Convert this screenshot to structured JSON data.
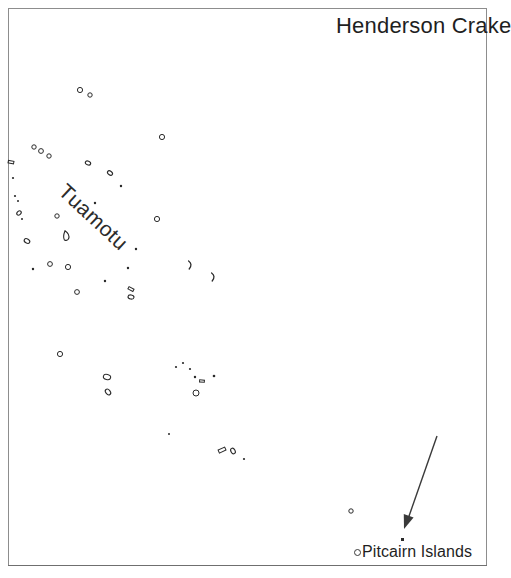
{
  "figure": {
    "title": "Henderson Crake",
    "region_label": "Tuamotu",
    "locality_label": "Pitcairn Islands",
    "frame_color": "#8d8d8d",
    "ink_color": "#2a2a2a",
    "background_color": "#ffffff"
  },
  "annotations": {
    "arrow": {
      "name": "pitcairn-pointer-arrow",
      "from_x": 437,
      "from_y": 436,
      "to_x": 404,
      "to_y": 529,
      "color": "#3a3a3a"
    },
    "pitcairn_marker": {
      "x": 403,
      "y": 540,
      "style": "filled-dot"
    },
    "legend_circle": {
      "x": 356,
      "y": 551,
      "style": "open-circle"
    }
  },
  "map_data": {
    "type": "point-map",
    "projection_note": "South Pacific: Tuamotu Archipelago to Pitcairn Islands",
    "islands": [
      {
        "x": 80,
        "y": 90,
        "r": 2.6,
        "shape": "ring"
      },
      {
        "x": 90,
        "y": 95,
        "r": 2.2,
        "shape": "ring"
      },
      {
        "x": 162,
        "y": 137,
        "r": 2.6,
        "shape": "ring"
      },
      {
        "x": 88,
        "y": 163,
        "r": 2.4,
        "shape": "blob"
      },
      {
        "x": 34,
        "y": 147,
        "r": 2.2,
        "shape": "ring"
      },
      {
        "x": 41,
        "y": 151,
        "r": 2.4,
        "shape": "ring"
      },
      {
        "x": 49,
        "y": 156,
        "r": 2.2,
        "shape": "ring"
      },
      {
        "x": 11,
        "y": 162,
        "r": 2.8,
        "shape": "bar"
      },
      {
        "x": 13,
        "y": 178,
        "r": 2.0,
        "shape": "dot"
      },
      {
        "x": 15,
        "y": 196,
        "r": 2.0,
        "shape": "dot"
      },
      {
        "x": 18,
        "y": 201,
        "r": 1.8,
        "shape": "dot"
      },
      {
        "x": 19,
        "y": 213,
        "r": 2.2,
        "shape": "blob"
      },
      {
        "x": 22,
        "y": 219,
        "r": 1.8,
        "shape": "dot"
      },
      {
        "x": 27,
        "y": 241,
        "r": 2.6,
        "shape": "blob"
      },
      {
        "x": 33,
        "y": 269,
        "r": 2.2,
        "shape": "dot"
      },
      {
        "x": 50,
        "y": 264,
        "r": 2.4,
        "shape": "ring"
      },
      {
        "x": 57,
        "y": 216,
        "r": 2.2,
        "shape": "ring"
      },
      {
        "x": 67,
        "y": 236,
        "r": 5.2,
        "shape": "atoll-long"
      },
      {
        "x": 110,
        "y": 173,
        "r": 2.4,
        "shape": "blob"
      },
      {
        "x": 95,
        "y": 203,
        "r": 2.2,
        "shape": "dot"
      },
      {
        "x": 121,
        "y": 186,
        "r": 2.2,
        "shape": "dot"
      },
      {
        "x": 157,
        "y": 219,
        "r": 2.6,
        "shape": "ring"
      },
      {
        "x": 136,
        "y": 249,
        "r": 2.2,
        "shape": "dot"
      },
      {
        "x": 68,
        "y": 267,
        "r": 2.6,
        "shape": "ring"
      },
      {
        "x": 77,
        "y": 292,
        "r": 2.4,
        "shape": "ring"
      },
      {
        "x": 105,
        "y": 281,
        "r": 2.2,
        "shape": "dot"
      },
      {
        "x": 131,
        "y": 289,
        "r": 2.8,
        "shape": "bar"
      },
      {
        "x": 131,
        "y": 297,
        "r": 2.6,
        "shape": "blob"
      },
      {
        "x": 128,
        "y": 268,
        "r": 2.2,
        "shape": "dot"
      },
      {
        "x": 190,
        "y": 265,
        "r": 4.0,
        "shape": "crescent"
      },
      {
        "x": 213,
        "y": 277,
        "r": 4.0,
        "shape": "crescent"
      },
      {
        "x": 60,
        "y": 354,
        "r": 2.6,
        "shape": "ring"
      },
      {
        "x": 107,
        "y": 377,
        "r": 3.2,
        "shape": "blob"
      },
      {
        "x": 108,
        "y": 392,
        "r": 2.8,
        "shape": "blob"
      },
      {
        "x": 176,
        "y": 367,
        "r": 2.0,
        "shape": "dot"
      },
      {
        "x": 183,
        "y": 363,
        "r": 2.0,
        "shape": "dot"
      },
      {
        "x": 190,
        "y": 369,
        "r": 2.0,
        "shape": "dot"
      },
      {
        "x": 195,
        "y": 377,
        "r": 2.2,
        "shape": "dot"
      },
      {
        "x": 202,
        "y": 381,
        "r": 2.4,
        "shape": "bar"
      },
      {
        "x": 196,
        "y": 393,
        "r": 3.0,
        "shape": "ring"
      },
      {
        "x": 214,
        "y": 376,
        "r": 2.4,
        "shape": "dot"
      },
      {
        "x": 169,
        "y": 434,
        "r": 1.8,
        "shape": "dot"
      },
      {
        "x": 222,
        "y": 450,
        "r": 3.6,
        "shape": "bar"
      },
      {
        "x": 233,
        "y": 451,
        "r": 2.6,
        "shape": "blob"
      },
      {
        "x": 244,
        "y": 459,
        "r": 2.0,
        "shape": "dot"
      },
      {
        "x": 351,
        "y": 511,
        "r": 2.2,
        "shape": "ring"
      }
    ]
  }
}
